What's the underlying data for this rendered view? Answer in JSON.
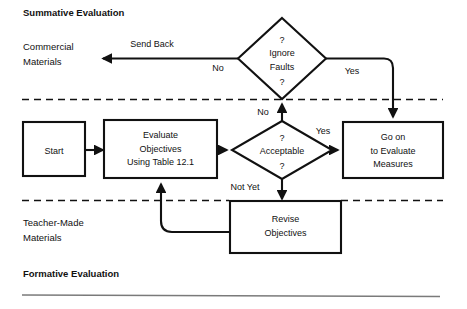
{
  "figure": {
    "type": "flowchart",
    "title_top": "Summative Evaluation",
    "title_bottom": "Formative Evaluation"
  },
  "bands": {
    "top_label": "Summative Evaluation",
    "bottom_label": "Formative Evaluation",
    "side_label_upper_line1": "Commercial",
    "side_label_upper_line2": "Materials",
    "side_label_lower_line1": "Teacher-Made",
    "side_label_lower_line2": "Materials"
  },
  "nodes": {
    "start": {
      "label": "Start",
      "shape": "rect"
    },
    "evaluate_objectives": {
      "line1": "Evaluate",
      "line2": "Objectives",
      "line3": "Using Table 12.1",
      "shape": "rect"
    },
    "acceptable": {
      "q_top": "?",
      "label": "Acceptable",
      "q_bottom": "?",
      "shape": "diamond"
    },
    "ignore_faults": {
      "q_top": "?",
      "line1": "Ignore",
      "line2": "Faults",
      "q_bottom": "?",
      "shape": "diamond"
    },
    "go_on": {
      "line1": "Go on",
      "line2": "to Evaluate",
      "line3": "Measures",
      "shape": "rect"
    },
    "revise_objectives": {
      "line1": "Revise",
      "line2": "Objectives",
      "shape": "rect"
    }
  },
  "edges": {
    "send_back": "Send Back",
    "ignore_faults_no": "No",
    "ignore_faults_yes": "Yes",
    "acceptable_no": "No",
    "acceptable_yes": "Yes",
    "acceptable_not_yet": "Not Yet"
  },
  "colors": {
    "ink": "#111111",
    "paper": "#ffffff",
    "rule": "#7a7a7a"
  }
}
